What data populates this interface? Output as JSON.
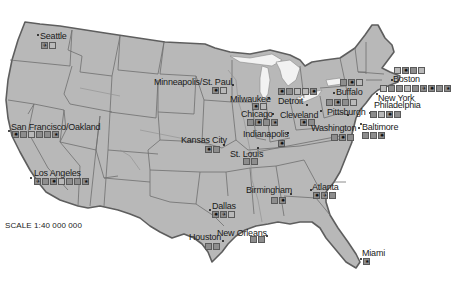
{
  "map": {
    "title": "United States major cities",
    "scale_label": "SCALE 1:40 000 000",
    "colors": {
      "land": "#b8b8b8",
      "border": "#5e5e5e",
      "state_border": "#6e6e6e",
      "water": "#ffffff",
      "lakes": "#f0f0f0",
      "icon_bg": "#8d8d8d"
    },
    "cities": [
      {
        "name": "Seattle",
        "icons": [
          "airport-icon",
          "landmark-icon"
        ]
      },
      {
        "name": "San Francisco/Oakland",
        "icons": [
          "sun-icon",
          "museum-icon",
          "wine-icon",
          "cup-icon",
          "building-icon",
          "star-icon"
        ]
      },
      {
        "name": "Los Angeles",
        "icons": [
          "airport-icon",
          "museum-icon",
          "sun-icon",
          "wine-icon",
          "tower-icon",
          "building-icon",
          "star-icon"
        ]
      },
      {
        "name": "Minneapolis/St. Paul",
        "icons": [
          "sun-icon",
          "wine-icon"
        ]
      },
      {
        "name": "Milwaukee",
        "icons": [
          "sun-icon",
          "wine-icon"
        ]
      },
      {
        "name": "Chicago",
        "icons": [
          "ship-icon",
          "sun-icon",
          "building-icon",
          "star-icon"
        ]
      },
      {
        "name": "Detroit",
        "icons": [
          "sun-icon",
          "cup-icon",
          "wine-icon",
          "landmark-icon",
          "sun-icon"
        ]
      },
      {
        "name": "Cleveland",
        "icons": [
          "sun-icon",
          "ship-icon"
        ]
      },
      {
        "name": "Indianapolis",
        "icons": [
          "sun-icon"
        ]
      },
      {
        "name": "Kansas City",
        "icons": [
          "sun-icon",
          "museum-icon"
        ]
      },
      {
        "name": "St. Louis",
        "icons": [
          "ship-icon",
          "building-icon"
        ]
      },
      {
        "name": "Buffalo",
        "icons": [
          "museum-icon",
          "sun-icon",
          "landmark-icon"
        ]
      },
      {
        "name": "Pittsburgh",
        "icons": [
          "ship-icon",
          "sun-icon",
          "cup-icon",
          "wine-icon"
        ]
      },
      {
        "name": "Washington",
        "icons": [
          "building-icon",
          "sun-icon",
          "cup-icon"
        ]
      },
      {
        "name": "Baltimore",
        "icons": [
          "ship-icon",
          "cup-icon",
          "sun-icon"
        ]
      },
      {
        "name": "Philadelphia",
        "icons": [
          "tower-icon",
          "wine-icon",
          "sun-icon",
          "building-icon"
        ]
      },
      {
        "name": "New York",
        "icons": [
          "wine-icon",
          "museum-icon",
          "tower-icon",
          "landmark-icon",
          "cup-icon",
          "airport-icon",
          "sun-icon",
          "building-icon",
          "star-icon"
        ]
      },
      {
        "name": "Boston",
        "icons": [
          "wine-icon",
          "sun-icon",
          "tower-icon",
          "landmark-icon"
        ]
      },
      {
        "name": "Birmingham",
        "icons": [
          "ship-icon",
          "sun-icon"
        ]
      },
      {
        "name": "Atlanta",
        "icons": [
          "sun-icon",
          "airport-icon",
          "tower-icon"
        ]
      },
      {
        "name": "Dallas",
        "icons": [
          "sun-icon",
          "airport-icon",
          "wine-icon"
        ]
      },
      {
        "name": "Houston",
        "icons": [
          "cup-icon",
          "building-icon"
        ]
      },
      {
        "name": "New Orleans",
        "icons": [
          "cup-icon",
          "building-icon"
        ]
      },
      {
        "name": "Miami",
        "icons": [
          "star-icon"
        ]
      }
    ]
  }
}
